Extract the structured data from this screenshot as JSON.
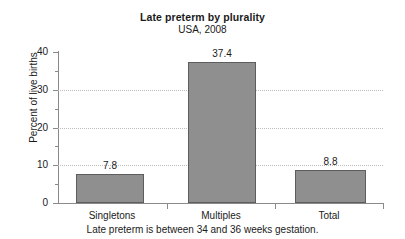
{
  "chart_data": {
    "type": "bar",
    "title": "Late preterm by plurality",
    "subtitle": "USA, 2008",
    "xlabel": "",
    "ylabel": "Percent of live births",
    "categories": [
      "Singletons",
      "Multiples",
      "Total"
    ],
    "values": [
      7.8,
      37.4,
      8.8
    ],
    "value_labels": [
      "7.8",
      "37.4",
      "8.8"
    ],
    "ylim": [
      0,
      40
    ],
    "yticks": [
      0,
      10,
      20,
      30,
      40
    ],
    "ytick_labels": [
      "0",
      "10",
      "20",
      "30",
      "40"
    ],
    "yticks_minor": [
      5,
      15,
      25,
      35
    ],
    "gridlines": [
      10,
      20,
      30
    ],
    "grid": true,
    "legend": false,
    "legend_position": "none",
    "annotation": "Late preterm is between 34 and 36 weeks gestation.",
    "series": [
      {
        "name": "Percent of live births",
        "values": [
          7.8,
          37.4,
          8.8
        ],
        "color": "#8f8f8f",
        "edge_color": "#5d5d5d"
      }
    ]
  },
  "colors": {
    "bar_fill": "#8f8f8f",
    "bar_edge": "#5d5d5d",
    "axis": "#8a8a8a",
    "grid": "#bdbdbd",
    "text": "#1a1a1a",
    "background": "#ffffff"
  }
}
